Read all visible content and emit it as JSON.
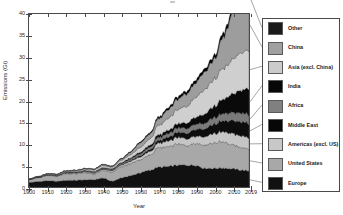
{
  "chart_data": {
    "type": "area",
    "title": "",
    "xlabel": "Year",
    "ylabel": "Emissions (Gt)",
    "xlim": [
      1900,
      2019
    ],
    "ylim": [
      0,
      40
    ],
    "grid": false,
    "legend_position": "right",
    "stacked": true,
    "xticks": [
      "1900",
      "1910",
      "1920",
      "1930",
      "1940",
      "1950",
      "1960",
      "1970",
      "1980",
      "1990",
      "2000",
      "2010",
      "2019"
    ],
    "xtick_values": [
      1900,
      1910,
      1920,
      1930,
      1940,
      1950,
      1960,
      1970,
      1980,
      1990,
      2000,
      2010,
      2019
    ],
    "yticks": [
      "0",
      "5",
      "10",
      "15",
      "20",
      "25",
      "30",
      "35",
      "40"
    ],
    "ytick_values": [
      0,
      5,
      10,
      15,
      20,
      25,
      30,
      35,
      40
    ],
    "x": [
      1900,
      1905,
      1910,
      1915,
      1920,
      1925,
      1930,
      1935,
      1940,
      1945,
      1950,
      1955,
      1960,
      1965,
      1970,
      1975,
      1980,
      1985,
      1990,
      1995,
      2000,
      2005,
      2010,
      2015,
      2019
    ],
    "series": [
      {
        "name": "Europe",
        "color": "#111111",
        "values": [
          1.05,
          1.25,
          1.45,
          1.3,
          1.55,
          1.55,
          1.65,
          1.7,
          2.05,
          1.35,
          2.1,
          2.6,
          3.25,
          3.85,
          4.55,
          4.7,
          5.0,
          5.05,
          5.05,
          4.35,
          4.3,
          4.4,
          4.2,
          3.9,
          3.7
        ]
      },
      {
        "name": "United States",
        "color": "#a8a8a8",
        "values": [
          0.65,
          0.9,
          1.2,
          1.2,
          1.55,
          1.5,
          1.65,
          1.35,
          1.7,
          2.1,
          2.55,
          2.85,
          3.0,
          3.45,
          4.4,
          4.6,
          4.85,
          4.6,
          5.15,
          5.4,
          5.9,
          6.0,
          5.55,
          5.15,
          5.05
        ]
      },
      {
        "name": "Americas (excl. US)",
        "color": "#c5c5c5",
        "values": [
          0.05,
          0.07,
          0.1,
          0.12,
          0.18,
          0.2,
          0.22,
          0.22,
          0.28,
          0.32,
          0.4,
          0.52,
          0.66,
          0.82,
          1.05,
          1.3,
          1.55,
          1.55,
          1.65,
          1.9,
          2.15,
          2.35,
          2.6,
          2.7,
          2.65
        ]
      },
      {
        "name": "Middle East",
        "color": "#0d0d0d",
        "values": [
          0.01,
          0.01,
          0.02,
          0.02,
          0.03,
          0.04,
          0.05,
          0.06,
          0.08,
          0.1,
          0.14,
          0.2,
          0.3,
          0.42,
          0.6,
          0.85,
          1.15,
          1.3,
          1.55,
          1.85,
          2.15,
          2.55,
          2.95,
          3.25,
          3.3
        ]
      },
      {
        "name": "Africa",
        "color": "#7a7a7a",
        "values": [
          0.03,
          0.04,
          0.06,
          0.07,
          0.09,
          0.11,
          0.13,
          0.15,
          0.18,
          0.2,
          0.25,
          0.33,
          0.42,
          0.52,
          0.68,
          0.82,
          1.0,
          1.1,
          1.2,
          1.3,
          1.45,
          1.65,
          1.85,
          2.0,
          2.05
        ]
      },
      {
        "name": "India",
        "color": "#0a0a0a",
        "values": [
          0.03,
          0.04,
          0.05,
          0.06,
          0.08,
          0.09,
          0.1,
          0.12,
          0.14,
          0.15,
          0.2,
          0.26,
          0.35,
          0.45,
          0.6,
          0.75,
          0.95,
          1.25,
          1.65,
          2.1,
          2.6,
          3.35,
          4.3,
          5.3,
          5.9
        ]
      },
      {
        "name": "Asia (excl. China)",
        "color": "#cfcfcf",
        "values": [
          0.05,
          0.07,
          0.1,
          0.13,
          0.18,
          0.22,
          0.28,
          0.36,
          0.46,
          0.35,
          0.55,
          0.75,
          1.05,
          1.45,
          2.2,
          2.7,
          3.3,
          3.75,
          4.6,
          5.6,
          6.2,
          7.1,
          8.0,
          8.6,
          8.8
        ]
      },
      {
        "name": "China",
        "color": "#9d9d9d",
        "values": [
          0.03,
          0.04,
          0.05,
          0.07,
          0.09,
          0.11,
          0.13,
          0.16,
          0.22,
          0.18,
          0.3,
          0.55,
          1.05,
          1.1,
          1.5,
          1.95,
          2.35,
          2.85,
          3.35,
          4.1,
          4.5,
          7.2,
          10.4,
          11.6,
          11.6
        ]
      },
      {
        "name": "Other",
        "color": "#000000",
        "values": [
          0.02,
          0.03,
          0.04,
          0.05,
          0.06,
          0.07,
          0.08,
          0.09,
          0.11,
          0.1,
          0.14,
          0.18,
          0.24,
          0.3,
          0.4,
          0.48,
          0.58,
          0.62,
          0.7,
          0.75,
          0.82,
          0.92,
          1.0,
          1.05,
          1.05
        ]
      }
    ],
    "legend_entries": [
      {
        "label": "Other",
        "color": "#1a1a1a"
      },
      {
        "label": "China",
        "color": "#a0a0a0"
      },
      {
        "label": "Asia (excl. China)",
        "color": "#cbcbcb"
      },
      {
        "label": "India",
        "color": "#070707"
      },
      {
        "label": "Africa",
        "color": "#808080"
      },
      {
        "label": "Middle East",
        "color": "#070707"
      },
      {
        "label": "Americas (excl. US)",
        "color": "#c8c8c8"
      },
      {
        "label": "United States",
        "color": "#a8a8a8"
      },
      {
        "label": "Europe",
        "color": "#111111"
      }
    ]
  },
  "axes": {
    "x_title": "Year",
    "y_title": "Emissions (Gt)"
  }
}
